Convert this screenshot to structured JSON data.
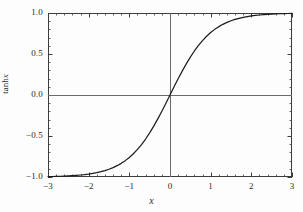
{
  "chart_data": {
    "type": "line",
    "title": "",
    "subtitle": "",
    "xlabel": "x",
    "ylabel": "tanh x",
    "ylabel_parts": {
      "function": "tanh",
      "variable": "x"
    },
    "xlim": [
      -3,
      3
    ],
    "ylim": [
      -1.0,
      1.0
    ],
    "grid": false,
    "legend": null,
    "legend_position": "none",
    "axis_lines_at_origin": true,
    "frame": true,
    "tick_direction": "in",
    "xticks": [
      -3,
      -2,
      -1,
      0,
      1,
      2,
      3
    ],
    "xtick_labels": [
      "-3",
      "-2",
      "-1",
      "0",
      "1",
      "2",
      "3"
    ],
    "x_minor_tick_step": 0.2,
    "yticks": [
      -1.0,
      -0.5,
      0.0,
      0.5,
      1.0
    ],
    "ytick_labels": [
      "-1.0",
      "-0.5",
      "0.0",
      "0.5",
      "1.0"
    ],
    "y_minor_tick_step": 0.1,
    "series": [
      {
        "name": "tanh x",
        "color": "#1a1a1a",
        "line_width": 1.2,
        "x": [
          -3.0,
          -2.9,
          -2.8,
          -2.7,
          -2.6,
          -2.5,
          -2.4,
          -2.3,
          -2.2,
          -2.1,
          -2.0,
          -1.9,
          -1.8,
          -1.7,
          -1.6,
          -1.5,
          -1.4,
          -1.3,
          -1.2,
          -1.1,
          -1.0,
          -0.9,
          -0.8,
          -0.7,
          -0.6,
          -0.5,
          -0.4,
          -0.3,
          -0.2,
          -0.1,
          0.0,
          0.1,
          0.2,
          0.3,
          0.4,
          0.5,
          0.6,
          0.7,
          0.8,
          0.9,
          1.0,
          1.1,
          1.2,
          1.3,
          1.4,
          1.5,
          1.6,
          1.7,
          1.8,
          1.9,
          2.0,
          2.1,
          2.2,
          2.3,
          2.4,
          2.5,
          2.6,
          2.7,
          2.8,
          2.9,
          3.0
        ],
        "values": [
          -0.995,
          -0.994,
          -0.9926,
          -0.991,
          -0.989,
          -0.9866,
          -0.9837,
          -0.9801,
          -0.9757,
          -0.9705,
          -0.964,
          -0.9562,
          -0.9468,
          -0.9354,
          -0.9217,
          -0.9051,
          -0.8854,
          -0.8617,
          -0.8337,
          -0.8005,
          -0.7616,
          -0.7163,
          -0.664,
          -0.6044,
          -0.537,
          -0.4621,
          -0.3799,
          -0.2913,
          -0.1974,
          -0.0997,
          0.0,
          0.0997,
          0.1974,
          0.2913,
          0.3799,
          0.4621,
          0.537,
          0.6044,
          0.664,
          0.7163,
          0.7616,
          0.8005,
          0.8337,
          0.8617,
          0.8854,
          0.9051,
          0.9217,
          0.9354,
          0.9468,
          0.9562,
          0.964,
          0.9705,
          0.9757,
          0.9801,
          0.9837,
          0.9866,
          0.989,
          0.991,
          0.9926,
          0.994,
          0.9951
        ]
      }
    ],
    "colors": {
      "curve": "#1a1a1a",
      "frame": "#3d3d3d",
      "axis": "#6a6a6a",
      "tick": "#3d3d3d",
      "text": "#2b2b2b",
      "background": "#fdfdfd"
    }
  }
}
